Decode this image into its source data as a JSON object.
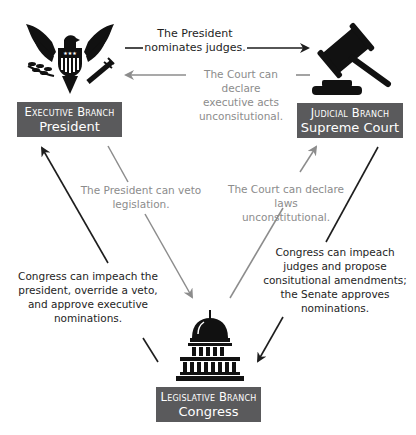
{
  "colors": {
    "box_bg": "#5a5a5c",
    "box_text": "#ffffff",
    "dark_arrow": "#1e1e1e",
    "gray_arrow": "#8c8c8c"
  },
  "nodes": {
    "executive": {
      "icon": "eagle-seal-icon",
      "branch": "Executive Branch",
      "name": "President"
    },
    "judicial": {
      "icon": "gavel-icon",
      "branch": "Judicial Branch",
      "name": "Supreme Court"
    },
    "legislative": {
      "icon": "capitol-icon",
      "branch": "Legislative Branch",
      "name": "Congress"
    }
  },
  "edges": {
    "exec_to_jud": {
      "from": "executive",
      "to": "judicial",
      "style": "dark",
      "lines": [
        "The President",
        "nominates judges."
      ]
    },
    "jud_to_exec": {
      "from": "judicial",
      "to": "executive",
      "style": "gray",
      "lines": [
        "The Court can declare",
        "executive acts",
        "unconsitutional."
      ]
    },
    "exec_to_leg": {
      "from": "executive",
      "to": "legislative",
      "style": "gray",
      "lines": [
        "The President can veto",
        "legislation."
      ]
    },
    "leg_to_jud": {
      "from": "legislative",
      "to": "judicial",
      "style": "gray",
      "lines": [
        "The Court can declare laws",
        "unconstitutional."
      ]
    },
    "leg_to_exec": {
      "from": "legislative",
      "to": "executive",
      "style": "dark",
      "lines": [
        "Congress can impeach the",
        "president, override a veto,",
        "and approve executive",
        "nominations."
      ]
    },
    "jud_to_leg": {
      "from": "judicial",
      "to": "legislative",
      "style": "dark",
      "lines": [
        "Congress can impeach",
        "judges and propose",
        "consitutional amendments;",
        "the Senate approves",
        "nominations."
      ]
    }
  }
}
